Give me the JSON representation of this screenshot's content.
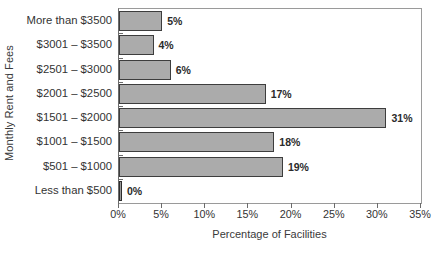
{
  "chart_data": {
    "type": "bar",
    "orientation": "horizontal",
    "title": "",
    "xlabel": "Percentage of Facilities",
    "ylabel": "Monthly Rent and Fees",
    "categories": [
      "More than $3500",
      "$3001 – $3500",
      "$2501 – $3000",
      "$2001 – $2500",
      "$1501 – $2000",
      "$1001 – $1500",
      "$501 – $1000",
      "Less than $500"
    ],
    "values": [
      5,
      4,
      6,
      17,
      31,
      18,
      19,
      0
    ],
    "value_labels": [
      "5%",
      "4%",
      "6%",
      "17%",
      "31%",
      "18%",
      "19%",
      "0%"
    ],
    "xlim": [
      0,
      35
    ],
    "xticks": [
      0,
      5,
      10,
      15,
      20,
      25,
      30,
      35
    ],
    "xtick_labels": [
      "0%",
      "5%",
      "10%",
      "15%",
      "20%",
      "25%",
      "30%",
      "35%"
    ],
    "grid": false,
    "legend": null,
    "bar_color": "#ababab",
    "bar_border_color": "#3d3d3d",
    "frame_color": "#9a9a9a",
    "text_color": "#333333"
  }
}
